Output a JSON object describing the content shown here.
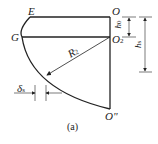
{
  "labels": {
    "E": "E",
    "O": "O",
    "G": "G",
    "O2": "O",
    "O2_sub": "2",
    "R2": "R",
    "R2_sub": "2",
    "h0": "h",
    "h0_sub": "0",
    "hs": "h",
    "hs_sub": "s",
    "delta": "δ",
    "delta_sub": "s",
    "Obottom": "O\""
  },
  "caption": "(a)"
}
